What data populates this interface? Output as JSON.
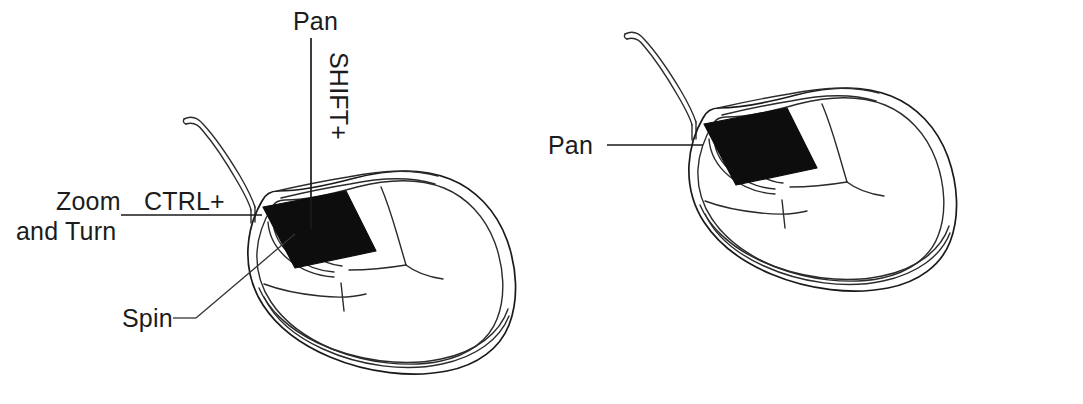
{
  "diagram": {
    "background_color": "#ffffff",
    "line_color": "#1a1a1a",
    "wheel_color": "#0d0d0d",
    "figures": [
      {
        "id": "left-mouse",
        "name": "mouse-with-modifier-keys",
        "labels": [
          {
            "id": "pan",
            "text": "Pan",
            "modifier": "SHIFT+",
            "orientation": "vertical"
          },
          {
            "id": "zoom-and-turn",
            "text_line1": "Zoom",
            "text_line2": "and Turn",
            "modifier": "CTRL+",
            "orientation": "horizontal"
          },
          {
            "id": "spin",
            "text": "Spin",
            "modifier": "",
            "orientation": "horizontal"
          }
        ]
      },
      {
        "id": "right-mouse",
        "name": "mouse-plain",
        "labels": [
          {
            "id": "pan",
            "text": "Pan",
            "modifier": "",
            "orientation": "horizontal"
          }
        ]
      }
    ]
  },
  "labels": {
    "pan_top": "Pan",
    "shift_modifier": "SHIFT+",
    "ctrl_modifier": "CTRL+",
    "zoom_line1": "Zoom",
    "zoom_line2": "and Turn",
    "spin": "Spin",
    "pan_right": "Pan"
  }
}
